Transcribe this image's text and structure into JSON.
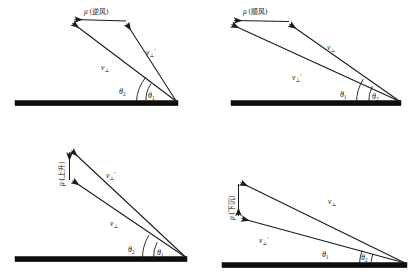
{
  "figure": {
    "type": "vector-diagram-grid",
    "rows": 2,
    "columns": 2,
    "background_color": "#ffffff",
    "line_color": "#1a1a1a",
    "ground_color": "#0d0d0d"
  },
  "symbols": {
    "mu": "μ",
    "v": "v",
    "perp": "⊥",
    "prime": "′",
    "theta": "θ",
    "sub_1": "1",
    "sub_2": "2",
    "paren_open": "(",
    "paren_close": ")"
  },
  "panels": [
    {
      "id": "upwind",
      "name": "panel-upwind",
      "mu_label": "μ",
      "mu_condition": "(逆风)",
      "mu_direction": "left",
      "mu_orientation": "horizontal",
      "vectors": [
        {
          "id": "v-perp-prime",
          "base": "v",
          "subscript": "⊥",
          "prime": "′",
          "position": "upper-right"
        },
        {
          "id": "v-perp",
          "base": "v",
          "subscript": "⊥",
          "prime": "",
          "position": "lower-left"
        }
      ],
      "angles": [
        {
          "id": "theta-2",
          "symbol": "θ",
          "subscript": "2",
          "position": "outer"
        },
        {
          "id": "theta-1",
          "symbol": "θ",
          "subscript": "1",
          "position": "inner"
        }
      ]
    },
    {
      "id": "tailwind",
      "name": "panel-tailwind",
      "mu_label": "μ",
      "mu_condition": "(顺风)",
      "mu_direction": "left",
      "mu_orientation": "horizontal",
      "vectors": [
        {
          "id": "v-perp",
          "base": "v",
          "subscript": "⊥",
          "prime": "",
          "position": "upper-right"
        },
        {
          "id": "v-perp-prime",
          "base": "v",
          "subscript": "⊥",
          "prime": "′",
          "position": "lower-left"
        }
      ],
      "angles": [
        {
          "id": "theta-1",
          "symbol": "θ",
          "subscript": "1",
          "position": "outer"
        },
        {
          "id": "theta-2",
          "symbol": "θ",
          "subscript": "2",
          "position": "inner"
        }
      ]
    },
    {
      "id": "ascend",
      "name": "panel-ascend",
      "mu_label": "μ",
      "mu_condition": "(上升)",
      "mu_direction": "up",
      "mu_orientation": "vertical",
      "vectors": [
        {
          "id": "v-perp-prime",
          "base": "v",
          "subscript": "⊥",
          "prime": "′",
          "position": "upper"
        },
        {
          "id": "v-perp",
          "base": "v",
          "subscript": "⊥",
          "prime": "",
          "position": "lower"
        }
      ],
      "angles": [
        {
          "id": "theta-2",
          "symbol": "θ",
          "subscript": "2",
          "position": "outer"
        },
        {
          "id": "theta-1",
          "symbol": "θ",
          "subscript": "1",
          "position": "inner"
        }
      ]
    },
    {
      "id": "descend",
      "name": "panel-descend",
      "mu_label": "μ",
      "mu_condition": "(下沉)",
      "mu_direction": "down",
      "mu_orientation": "vertical",
      "vectors": [
        {
          "id": "v-perp",
          "base": "v",
          "subscript": "⊥",
          "prime": "",
          "position": "upper"
        },
        {
          "id": "v-perp-prime",
          "base": "v",
          "subscript": "⊥",
          "prime": "′",
          "position": "lower"
        }
      ],
      "angles": [
        {
          "id": "theta-1",
          "symbol": "θ",
          "subscript": "1",
          "position": "outer"
        },
        {
          "id": "theta-2",
          "symbol": "θ",
          "subscript": "2",
          "position": "inner"
        }
      ]
    }
  ]
}
